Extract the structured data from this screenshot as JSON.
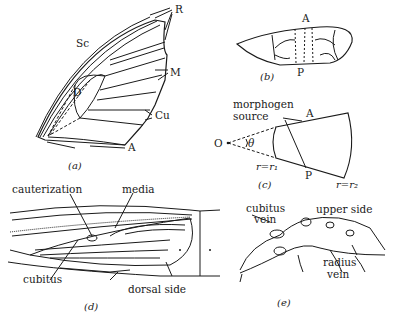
{
  "figure": {
    "panels": [
      {
        "id": "a",
        "caption": "(a)",
        "labels": {
          "sc": "Sc",
          "r": "R",
          "m": "M",
          "cu": "Cu",
          "a": "A",
          "d": "D"
        }
      },
      {
        "id": "b",
        "caption": "(b)",
        "labels": {
          "a": "A",
          "p": "P"
        }
      },
      {
        "id": "c",
        "caption": "(c)",
        "labels": {
          "morphogen": "morphogen",
          "source": "source",
          "o": "O",
          "theta": "θ",
          "a": "A",
          "p": "P",
          "r1": "r=r₁",
          "r2": "r=r₂"
        }
      },
      {
        "id": "d",
        "caption": "(d)",
        "labels": {
          "cauterization": "cauterization",
          "media": "media",
          "cubitus": "cubitus",
          "dorsal": "dorsal side"
        }
      },
      {
        "id": "e",
        "caption": "(e)",
        "labels": {
          "cubitus": "cubitus",
          "cubitus_vein": "vein",
          "upper": "upper side",
          "radius": "radius",
          "radius_vein": "vein"
        }
      }
    ]
  },
  "colors": {
    "ink": "#1a1a1a",
    "background": "#ffffff"
  }
}
